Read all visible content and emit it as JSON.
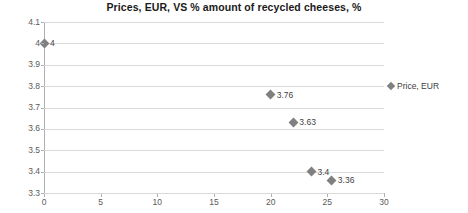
{
  "chart_data": {
    "type": "scatter",
    "title": "Prices, EUR, VS % amount of recycled cheeses, %",
    "xlabel": "",
    "ylabel": "",
    "xlim": [
      0,
      30
    ],
    "ylim": [
      3.3,
      4.1
    ],
    "xticks": [
      "0",
      "5",
      "10",
      "15",
      "20",
      "25",
      "30"
    ],
    "yticks": [
      "3.3",
      "3.4",
      "3.5",
      "3.6",
      "3.7",
      "3.8",
      "3.9",
      "4",
      "4.1"
    ],
    "grid": "horizontal",
    "legend_position": "right",
    "series": [
      {
        "name": "Price, EUR",
        "marker": "diamond",
        "color": "#808080",
        "points": [
          {
            "x": 0,
            "y": 4,
            "label": "4"
          },
          {
            "x": 20,
            "y": 3.76,
            "label": "3.76"
          },
          {
            "x": 22,
            "y": 3.63,
            "label": "3.63"
          },
          {
            "x": 23.6,
            "y": 3.4,
            "label": "3.4"
          },
          {
            "x": 25.4,
            "y": 3.36,
            "label": "3.36"
          }
        ]
      }
    ]
  },
  "legend": {
    "entries": [
      {
        "label": "Price, EUR"
      }
    ]
  },
  "colors": {
    "marker": "#808080",
    "gridline": "#d9d9d9",
    "axis": "#b0b0b0",
    "title": "#1a1a1a",
    "tick_text": "#5a5a5a"
  }
}
